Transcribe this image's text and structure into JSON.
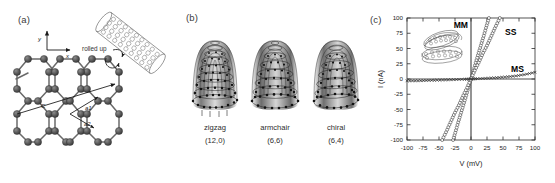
{
  "figure": {
    "panels": [
      {
        "id": "a",
        "label": "(a)"
      },
      {
        "id": "b",
        "label": "(b)"
      },
      {
        "id": "c",
        "label": "(c)"
      }
    ]
  },
  "panel_a": {
    "label": "(a)",
    "axis_x_label": "x",
    "axis_y_label": "y",
    "rolled_up_text": "rolled up",
    "chiral_vector_label": "C",
    "lattice_vector_1_label": "a1",
    "lattice_vector_2_label": "a2",
    "lattice_description": "graphene-honeycomb-lattice",
    "nanotube_description": "rolled-up-nanotube-cylinder"
  },
  "panel_b": {
    "label": "(b)",
    "tubes": [
      {
        "name": "zigzag",
        "indices": "(12,0)"
      },
      {
        "name": "armchair",
        "indices": "(6,6)"
      },
      {
        "name": "chiral",
        "indices": "(6,4)"
      }
    ]
  },
  "panel_c": {
    "label": "(c)",
    "inset_description": "crossed-nanotube-junction"
  },
  "chart_data": {
    "type": "line",
    "title": "",
    "xlabel": "V (mV)",
    "ylabel": "I (nA)",
    "xlim": [
      -100,
      100
    ],
    "ylim": [
      -100,
      100
    ],
    "xticks": [
      -100,
      -75,
      -50,
      -25,
      0,
      25,
      50,
      75,
      100
    ],
    "yticks": [
      -100,
      -75,
      -50,
      -25,
      0,
      25,
      50,
      75,
      100
    ],
    "grid": false,
    "legend_position": "inline-annotations",
    "series": [
      {
        "name": "MM",
        "label": "MM",
        "marker": "open-circle",
        "slope_nA_per_mV": 3.57,
        "x": [
          -28,
          -24,
          -20,
          -16,
          -12,
          -8,
          -4,
          0,
          4,
          8,
          12,
          16,
          20,
          24,
          28
        ],
        "y": [
          -100,
          -86,
          -71,
          -57,
          -43,
          -29,
          -14,
          0,
          14,
          29,
          43,
          57,
          71,
          86,
          100
        ]
      },
      {
        "name": "SS",
        "label": "SS",
        "marker": "open-circle",
        "slope_nA_per_mV": 2.22,
        "x": [
          -45,
          -38,
          -32,
          -26,
          -19,
          -13,
          -6,
          0,
          6,
          13,
          19,
          26,
          32,
          38,
          45
        ],
        "y": [
          -100,
          -85,
          -71,
          -57,
          -43,
          -29,
          -14,
          0,
          14,
          29,
          43,
          57,
          71,
          85,
          100
        ]
      },
      {
        "name": "MS",
        "label": "MS",
        "marker": "cross",
        "slope_nA_per_mV": 0.05,
        "x": [
          -100,
          -85,
          -70,
          -55,
          -40,
          -25,
          -10,
          0,
          10,
          25,
          40,
          55,
          70,
          85,
          100
        ],
        "y": [
          -3,
          -3,
          -2.5,
          -2,
          -1.5,
          -1,
          -0.4,
          0,
          0.5,
          1.3,
          2.2,
          3.4,
          5,
          7.5,
          11
        ]
      }
    ]
  }
}
